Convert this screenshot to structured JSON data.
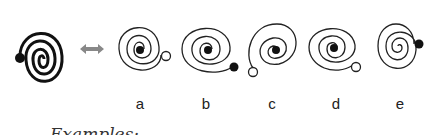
{
  "figure": {
    "reference": {
      "description": "thick spiral with black dot at outer end on left"
    },
    "arrow": {
      "icon": "double-arrow-icon",
      "color": "#888888"
    },
    "options": [
      {
        "label": "a",
        "dot": "open",
        "dot_position": "right"
      },
      {
        "label": "b",
        "dot": "filled",
        "dot_position": "bottom-right"
      },
      {
        "label": "c",
        "dot": "open",
        "dot_position": "bottom-left"
      },
      {
        "label": "d",
        "dot": "open",
        "dot_position": "bottom-right"
      },
      {
        "label": "e",
        "dot": "filled",
        "dot_position": "right"
      }
    ],
    "caption": "Examples:"
  }
}
